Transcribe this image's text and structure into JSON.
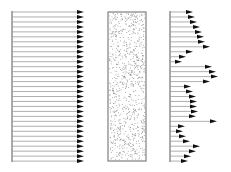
{
  "diagram": {
    "colors": {
      "line": "#9a9a9a",
      "arrowhead": "#111111",
      "axis": "#555555",
      "stipple": "#8a8a8a",
      "box_border": "#666666"
    },
    "panels": [
      {
        "id": "uniform-profile",
        "axis_x": 12,
        "y_start": 12,
        "y_step": 4.97,
        "count": 31,
        "tips": [
          84,
          84,
          84,
          84,
          84,
          84,
          84,
          84,
          84,
          84,
          84,
          84,
          84,
          84,
          84,
          84,
          84,
          84,
          84,
          84,
          84,
          84,
          84,
          84,
          84,
          84,
          84,
          84,
          84,
          84,
          84
        ]
      },
      {
        "id": "stippled-block",
        "x": 108,
        "y": 12,
        "width": 38,
        "height": 149,
        "dot_count": 900
      },
      {
        "id": "variable-profile",
        "axis_x": 170,
        "y_start": 12,
        "y_step": 4.97,
        "count": 31,
        "tips": [
          193,
          195,
          197,
          200,
          202,
          204,
          205,
          210,
          193,
          186,
          182,
          212,
          216,
          218,
          210,
          191,
          193,
          196,
          197,
          197,
          198,
          196,
          217,
          185,
          183,
          186,
          190,
          200,
          196,
          191,
          188
        ]
      }
    ]
  }
}
